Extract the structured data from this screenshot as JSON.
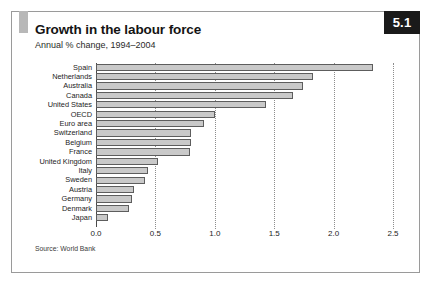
{
  "figure": {
    "badge": "5.1",
    "title": "Growth in the labour force",
    "subtitle": "Annual % change, 1994–2004",
    "source": "Source: World Bank",
    "accent_color": "#b8b8b8",
    "badge_bg": "#1a1a1a",
    "badge_fg": "#ffffff",
    "bar_fill": "#c9c9c9",
    "bar_stroke": "#5d5d5d",
    "border_color": "#9a9a9a"
  },
  "chart_data": {
    "type": "bar",
    "orientation": "horizontal",
    "title": "Growth in the labour force",
    "subtitle": "Annual % change, 1994–2004",
    "xlabel": "",
    "ylabel": "",
    "xlim": [
      0.0,
      2.5
    ],
    "xticks": [
      0.0,
      0.5,
      1.0,
      1.5,
      2.0,
      2.5
    ],
    "xtick_labels": [
      "0.0",
      "0.5",
      "1.0",
      "1.5",
      "2.0",
      "2.5"
    ],
    "grid": "vertical-dotted",
    "legend": "none",
    "source": "Source: World Bank",
    "categories": [
      "Spain",
      "Netherlands",
      "Australia",
      "Canada",
      "United States",
      "OECD",
      "Euro area",
      "Switzerland",
      "Belgium",
      "France",
      "United Kingdom",
      "Italy",
      "Sweden",
      "Austria",
      "Germany",
      "Denmark",
      "Japan"
    ],
    "values": [
      2.33,
      1.83,
      1.74,
      1.66,
      1.43,
      1.0,
      0.91,
      0.8,
      0.8,
      0.79,
      0.52,
      0.44,
      0.41,
      0.32,
      0.3,
      0.28,
      0.1
    ]
  }
}
